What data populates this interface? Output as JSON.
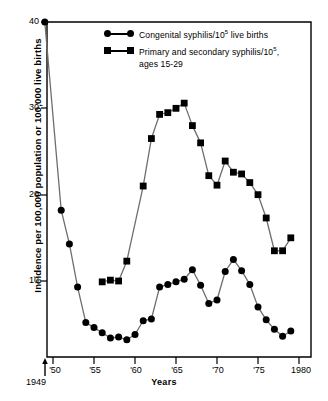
{
  "chart_data": {
    "type": "line",
    "title": "",
    "subtitle": "",
    "xlabel": "Years",
    "ylabel": "Incidence per 100,000 population or 100,000 live births",
    "xlim": [
      1949,
      1980
    ],
    "ylim": [
      0,
      40
    ],
    "grid": false,
    "legend_position": "top-center",
    "x_tick_labels": [
      "'50",
      "'55",
      "'60",
      "'65",
      "'70",
      "'75",
      "1980"
    ],
    "x_tick_values": [
      1950,
      1955,
      1960,
      1965,
      1970,
      1975,
      1980
    ],
    "y_tick_labels": [
      "10",
      "20",
      "30",
      "40"
    ],
    "y_tick_values": [
      10,
      20,
      30,
      40
    ],
    "annotations": [
      {
        "text": "1949",
        "x": 1949,
        "note": "origin arrow marker below axis start"
      }
    ],
    "series": [
      {
        "name": "Congenital syphilis/10⁵ live births",
        "marker": "circle",
        "x": [
          1949,
          1951,
          1952,
          1953,
          1954,
          1955,
          1956,
          1957,
          1958,
          1959,
          1960,
          1961,
          1962,
          1963,
          1964,
          1965,
          1966,
          1967,
          1968,
          1969,
          1970,
          1971,
          1972,
          1973,
          1974,
          1975,
          1976,
          1977,
          1978,
          1979
        ],
        "values": [
          40.0,
          18.2,
          14.3,
          9.3,
          5.2,
          4.6,
          4.0,
          3.4,
          3.5,
          3.2,
          3.8,
          5.4,
          5.6,
          9.3,
          9.6,
          9.9,
          10.2,
          11.3,
          9.5,
          7.4,
          7.8,
          11.1,
          12.5,
          11.2,
          9.6,
          7.0,
          5.5,
          4.4,
          3.6,
          4.2
        ]
      },
      {
        "name": "Primary and secondary syphilis/10⁵, ages 15-29",
        "marker": "square",
        "x": [
          1956,
          1957,
          1958,
          1959,
          1961,
          1962,
          1963,
          1964,
          1965,
          1966,
          1967,
          1968,
          1969,
          1970,
          1971,
          1972,
          1973,
          1974,
          1975,
          1976,
          1977,
          1978,
          1979
        ],
        "values": [
          9.9,
          10.1,
          10.0,
          12.3,
          21.0,
          26.5,
          29.3,
          29.5,
          30.0,
          30.6,
          28.0,
          26.0,
          22.2,
          21.1,
          23.9,
          22.6,
          22.4,
          21.4,
          20.0,
          17.3,
          13.5,
          13.5,
          15.0
        ]
      }
    ]
  },
  "legend": {
    "entries": [
      {
        "label_main": "Congenital syphilis/10",
        "label_sup": "5",
        "label_tail": " live births",
        "marker": "circle-marker"
      },
      {
        "label_main": "Primary and secondary syphilis/10",
        "label_sup": "5",
        "label_tail": ",",
        "label_line2": "ages 15-29",
        "marker": "square-marker"
      }
    ]
  },
  "axes": {
    "y_title": "Incidence per 100,000 population or 100,000 live births",
    "x_title": "Years",
    "origin_label": "1949",
    "y_ticks": [
      "40",
      "30",
      "20",
      "10"
    ],
    "x_ticks": [
      "'50",
      "'55",
      "'60",
      "'65",
      "'70",
      "'75",
      "1980"
    ]
  },
  "colors": {
    "line": "#6e6e6e",
    "marker": "#000000",
    "axis": "#000000",
    "background": "#ffffff"
  }
}
